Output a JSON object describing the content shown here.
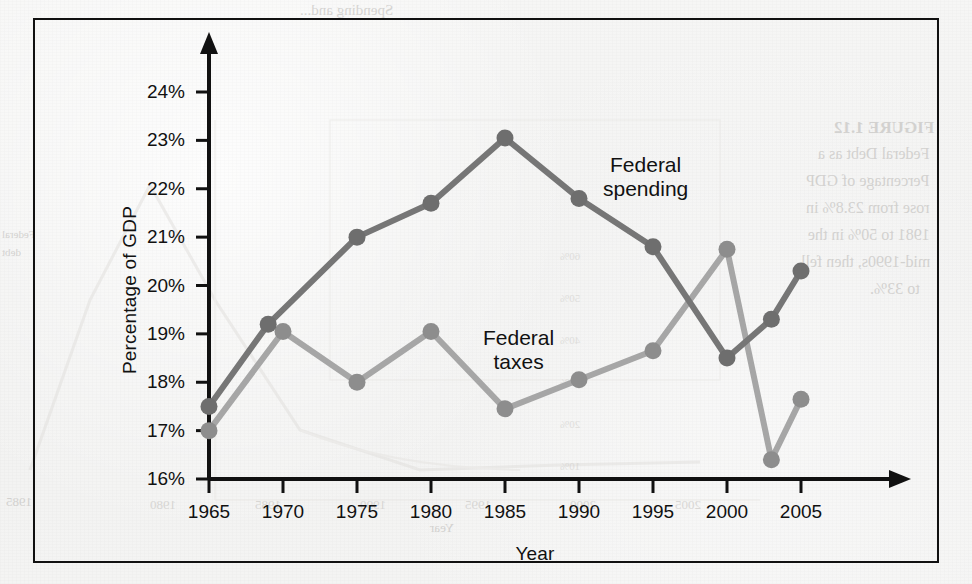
{
  "figure": {
    "frame_color": "#111111",
    "background": "#f2f2f1"
  },
  "chart_data": {
    "type": "line",
    "title": "",
    "xlabel": "Year",
    "ylabel": "Percentage of GDP",
    "xlim": [
      1963.2,
      2007.5
    ],
    "ylim": [
      16,
      24
    ],
    "grid": false,
    "legend": "inline-annotation",
    "xticks": [
      "1965",
      "1970",
      "1975",
      "1980",
      "1985",
      "1990",
      "1995",
      "2000",
      "2005"
    ],
    "xtick_values": [
      1965,
      1970,
      1975,
      1980,
      1985,
      1990,
      1995,
      2000,
      2005
    ],
    "yticks": [
      "16%",
      "17%",
      "18%",
      "19%",
      "20%",
      "21%",
      "22%",
      "23%",
      "24%"
    ],
    "ytick_values": [
      16,
      17,
      18,
      19,
      20,
      21,
      22,
      23,
      24
    ],
    "series": [
      {
        "name": "Federal spending",
        "color": "#767676",
        "marker_color": "#6e6e6e",
        "x": [
          1965,
          1969,
          1975,
          1980,
          1985,
          1990,
          1995,
          2000,
          2003,
          2005
        ],
        "values": [
          17.5,
          19.2,
          21.0,
          21.7,
          23.05,
          21.8,
          20.8,
          18.5,
          19.3,
          20.3
        ]
      },
      {
        "name": "Federal taxes",
        "color": "#a6a6a6",
        "marker_color": "#8d8d8d",
        "x": [
          1965,
          1970,
          1975,
          1980,
          1985,
          1990,
          1995,
          2000,
          2003,
          2005
        ],
        "values": [
          17.0,
          19.05,
          18.0,
          19.05,
          17.45,
          18.05,
          18.65,
          20.75,
          16.4,
          17.65
        ]
      }
    ],
    "annotations": [
      {
        "text": "Federal\nspending",
        "x": 1993.2,
        "y": 22.45
      },
      {
        "text": "Federal\ntaxes",
        "x": 1987.0,
        "y": 19.35
      }
    ]
  },
  "bleed_through": {
    "top_line": "Spending and...",
    "figure_title": "FIGURE 1.12",
    "lines": [
      "Federal Debt as a",
      "Percentage of GDP",
      "rose from 23.8% in",
      "1981 to 50% in the",
      "mid-1990s, then fell",
      "to 33%."
    ],
    "left_notes": [
      "Federal",
      "debt"
    ],
    "bottom_left": "1985",
    "years": [
      "1980",
      "1985",
      "1990",
      "1995",
      "2000",
      "2005"
    ],
    "axis_title": "Year",
    "yticks": [
      "60%",
      "50%",
      "40%",
      "30%",
      "20%",
      "10%"
    ]
  }
}
